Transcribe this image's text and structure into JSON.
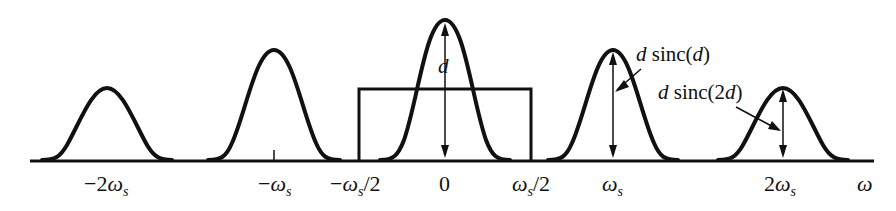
{
  "diagram": {
    "axis_label": "ω",
    "tick_labels": [
      "−2ωs",
      "−ωs",
      "−ωs/2",
      "0",
      "ωs/2",
      "ωs",
      "2ωs"
    ],
    "annotations": {
      "center_height": "d",
      "first_replica": "d sinc(d)",
      "second_replica": "d sinc(2d)"
    },
    "lobes": [
      {
        "center": "−2ωs",
        "relative_height": 0.56
      },
      {
        "center": "−ωs",
        "relative_height": 0.82
      },
      {
        "center": "0",
        "relative_height": 1.0
      },
      {
        "center": "ωs",
        "relative_height": 0.82
      },
      {
        "center": "2ωs",
        "relative_height": 0.56
      }
    ],
    "filter": {
      "type": "ideal lowpass",
      "from": "−ωs/2",
      "to": "ωs/2"
    }
  }
}
